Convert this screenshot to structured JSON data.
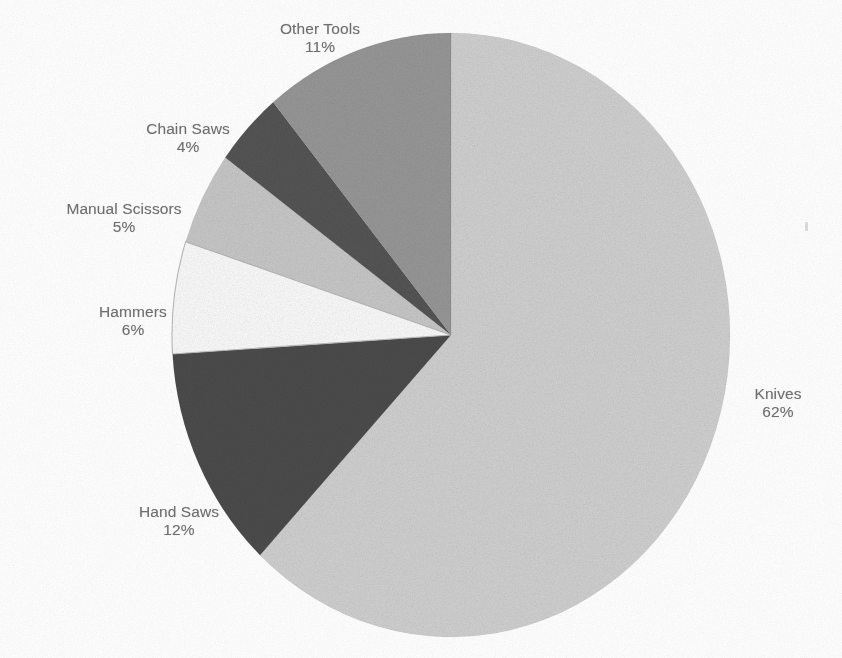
{
  "page": {
    "background_color": "#ffffff",
    "text_color": "#6e6e6e",
    "width": 842,
    "height": 658
  },
  "chart_data": {
    "type": "pie",
    "title": "",
    "subtitle": "",
    "xlabel": "",
    "ylabel": "",
    "legend_position": "none",
    "grid": false,
    "labels_outside": true,
    "start_angle_deg": 0,
    "direction": "clockwise",
    "categories": [
      "Knives",
      "Hand Saws",
      "Hammers",
      "Manual Scissors",
      "Chain Saws",
      "Other Tools"
    ],
    "values": [
      62,
      12,
      6,
      5,
      4,
      11
    ],
    "value_unit": "%",
    "slices": [
      {
        "name": "Knives",
        "label": "Knives",
        "value": 62,
        "value_text": "62%",
        "color": "#d4d4d4",
        "start_deg": 0,
        "end_deg": 223.2
      },
      {
        "name": "Hand Saws",
        "label": "Hand Saws",
        "value": 12,
        "value_text": "12%",
        "color": "#4d4d4d",
        "start_deg": 223.2,
        "end_deg": 266.4
      },
      {
        "name": "Hammers",
        "label": "Hammers",
        "value": 6,
        "value_text": "6%",
        "color": "#ffffff",
        "start_deg": 266.4,
        "end_deg": 288.0
      },
      {
        "name": "Manual Scissors",
        "label": "Manual Scissors",
        "value": 5,
        "value_text": "5%",
        "color": "#cbcbcb",
        "start_deg": 288.0,
        "end_deg": 306.0
      },
      {
        "name": "Chain Saws",
        "label": "Chain Saws",
        "value": 4,
        "value_text": "4%",
        "color": "#565656",
        "start_deg": 306.0,
        "end_deg": 320.4
      },
      {
        "name": "Other Tools",
        "label": "Other Tools",
        "value": 11,
        "value_text": "11%",
        "color": "#9a9a9a",
        "start_deg": 320.4,
        "end_deg": 360.0
      }
    ]
  },
  "labels": {
    "other_tools": {
      "name": "Other Tools",
      "percent": "11%"
    },
    "chain_saws": {
      "name": "Chain Saws",
      "percent": "4%"
    },
    "manual_scissors": {
      "name": "Manual Scissors",
      "percent": "5%"
    },
    "hammers": {
      "name": "Hammers",
      "percent": "6%"
    },
    "hand_saws": {
      "name": "Hand Saws",
      "percent": "12%"
    },
    "knives": {
      "name": "Knives",
      "percent": "62%"
    }
  }
}
